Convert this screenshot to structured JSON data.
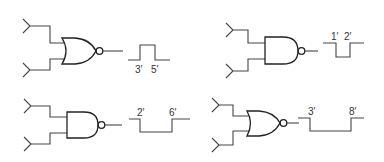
{
  "figure": {
    "panels": [
      {
        "id": "top-left",
        "gate": "NOR",
        "waveform": "positive pulse",
        "labels": [
          "3′",
          "5′"
        ]
      },
      {
        "id": "top-right",
        "gate": "NAND",
        "waveform": "negative pulse",
        "labels": [
          "1′",
          "2′"
        ]
      },
      {
        "id": "bottom-left",
        "gate": "NAND",
        "waveform": "negative pulse",
        "labels": [
          "2′",
          "6′"
        ]
      },
      {
        "id": "bottom-right",
        "gate": "NOR",
        "waveform": "negative pulse",
        "labels": [
          "3′",
          "8′"
        ]
      }
    ],
    "colors": {
      "line": "#222222",
      "background": "#ffffff"
    }
  }
}
